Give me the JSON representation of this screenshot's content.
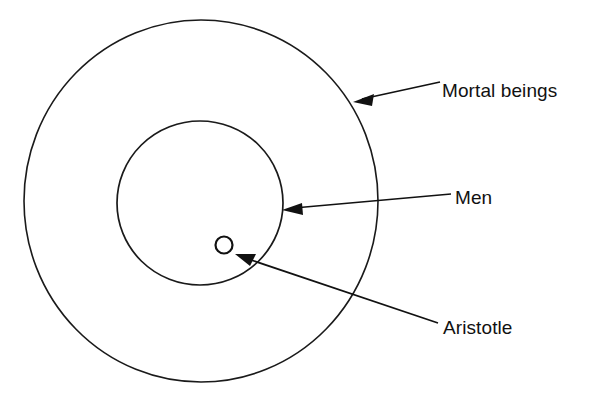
{
  "diagram": {
    "type": "euler-diagram",
    "background_color": "#ffffff",
    "stroke_color": "#111111",
    "sets": [
      {
        "id": "mortal-beings",
        "label": "Mortal beings",
        "shape": "ellipse",
        "cx": 201,
        "cy": 201,
        "rx": 177,
        "ry": 181,
        "level": 0
      },
      {
        "id": "men",
        "label": "Men",
        "shape": "circle",
        "cx": 200,
        "cy": 203,
        "rx": 83,
        "ry": 82,
        "level": 1
      },
      {
        "id": "aristotle",
        "label": "Aristotle",
        "shape": "circle",
        "cx": 224,
        "cy": 245,
        "rx": 9,
        "ry": 9,
        "level": 2
      }
    ],
    "annotations": [
      {
        "id": "mortal-beings-callout",
        "label": "Mortal beings",
        "label_x": 442,
        "label_y": 97,
        "line_start_x": 440,
        "line_start_y": 82,
        "line_end_x": 357,
        "line_end_y": 101,
        "arrow_tip_x": 353,
        "arrow_tip_y": 102
      },
      {
        "id": "men-callout",
        "label": "Men",
        "label_x": 455,
        "label_y": 204,
        "line_start_x": 451,
        "line_start_y": 194,
        "line_end_x": 288,
        "line_end_y": 209,
        "arrow_tip_x": 282,
        "arrow_tip_y": 210
      },
      {
        "id": "aristotle-callout",
        "label": "Aristotle",
        "label_x": 443,
        "label_y": 334,
        "line_start_x": 438,
        "line_start_y": 323,
        "line_end_x": 243,
        "line_end_y": 257,
        "arrow_tip_x": 235,
        "arrow_tip_y": 254
      }
    ]
  }
}
